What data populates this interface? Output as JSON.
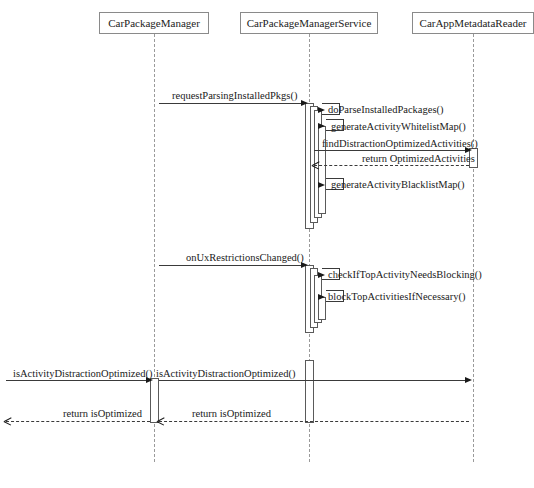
{
  "diagram": {
    "type": "uml-sequence-diagram",
    "width": 534,
    "height": 488,
    "background_color": "#ffffff",
    "line_color": "#3a3a3a",
    "lifeline_color": "#9a9a9a",
    "box_border_color": "#8a8a8a"
  },
  "participants": [
    {
      "id": "car-package-manager",
      "label": "CarPackageManager",
      "box_x": 99,
      "box_y": 12,
      "box_width": 110,
      "lifeline_x": 154,
      "lifeline_top": 34,
      "lifeline_bottom": 462
    },
    {
      "id": "car-package-manager-service",
      "label": "CarPackageManagerService",
      "box_x": 240,
      "box_y": 12,
      "box_width": 138,
      "lifeline_x": 309,
      "lifeline_top": 34,
      "lifeline_bottom": 462
    },
    {
      "id": "car-app-metadata-reader",
      "label": "CarAppMetadataReader",
      "box_x": 412,
      "box_y": 12,
      "box_width": 122,
      "lifeline_x": 473,
      "lifeline_top": 34,
      "lifeline_bottom": 462
    }
  ],
  "messages": [
    {
      "id": "m1",
      "label": "requestParsingInstalledPkgs()",
      "kind": "call",
      "style": "solid",
      "direction": "right",
      "from": "car-package-manager",
      "to": "car-package-manager-service",
      "y": 103,
      "label_x": 172,
      "label_y": 91
    },
    {
      "id": "m2",
      "label": "doParseInstalledPackages()",
      "kind": "self-call",
      "style": "solid",
      "direction": "self",
      "from": "car-package-manager-service",
      "to": "car-package-manager-service",
      "y": 110,
      "label_x": 328,
      "label_y": 105
    },
    {
      "id": "m3",
      "label": "generateActivityWhitelistMap()",
      "kind": "self-call",
      "style": "solid",
      "direction": "self",
      "from": "car-package-manager-service",
      "to": "car-package-manager-service",
      "y": 126,
      "label_x": 331,
      "label_y": 122
    },
    {
      "id": "m4",
      "label": "findDistractionOptimizedActivities()",
      "kind": "call",
      "style": "solid",
      "direction": "right",
      "from": "car-package-manager-service",
      "to": "car-app-metadata-reader",
      "y": 150,
      "label_x": 322,
      "label_y": 139
    },
    {
      "id": "m5",
      "label": "return OptimizedActivities",
      "kind": "return",
      "style": "dashed",
      "direction": "left",
      "from": "car-app-metadata-reader",
      "to": "car-package-manager-service",
      "y": 165,
      "label_x": 362,
      "label_y": 154
    },
    {
      "id": "m6",
      "label": "generateActivityBlacklistMap()",
      "kind": "self-call",
      "style": "solid",
      "direction": "self",
      "from": "car-package-manager-service",
      "to": "car-package-manager-service",
      "y": 185,
      "label_x": 331,
      "label_y": 180
    },
    {
      "id": "m7",
      "label": "onUxRestrictionsChanged()",
      "kind": "call",
      "style": "solid",
      "direction": "right",
      "from": "car-package-manager",
      "to": "car-package-manager-service",
      "y": 265,
      "label_x": 186,
      "label_y": 253
    },
    {
      "id": "m8",
      "label": "checkIfTopActivityNeedsBlocking()",
      "kind": "self-call",
      "style": "solid",
      "direction": "self",
      "from": "car-package-manager-service",
      "to": "car-package-manager-service",
      "y": 275,
      "label_x": 328,
      "label_y": 270
    },
    {
      "id": "m9",
      "label": "blockTopActivitiesIfNecessary()",
      "kind": "self-call",
      "style": "solid",
      "direction": "self",
      "from": "car-package-manager-service",
      "to": "car-package-manager-service",
      "y": 297,
      "label_x": 328,
      "label_y": 292
    },
    {
      "id": "m10",
      "label": "isActivityDistractionOptimized()",
      "kind": "call",
      "style": "solid",
      "direction": "right",
      "from": "external",
      "to": "car-package-manager",
      "y": 380,
      "label_x": 13,
      "label_y": 369
    },
    {
      "id": "m11",
      "label": "isActivityDistractionOptimized()",
      "kind": "call",
      "style": "solid",
      "direction": "right",
      "from": "car-package-manager",
      "to": "car-app-metadata-reader",
      "y": 380,
      "label_x": 156,
      "label_y": 369
    },
    {
      "id": "m12",
      "label": "return isOptimized",
      "kind": "return",
      "style": "dashed",
      "direction": "left",
      "from": "car-app-metadata-reader",
      "to": "car-package-manager",
      "y": 421,
      "label_x": 192,
      "label_y": 409
    },
    {
      "id": "m13",
      "label": "return isOptimized",
      "kind": "return",
      "style": "dashed",
      "direction": "left",
      "from": "car-package-manager",
      "to": "external",
      "y": 421,
      "label_x": 63,
      "label_y": 409
    }
  ],
  "activations": [
    {
      "id": "a1",
      "participant": "car-package-manager-service",
      "x": 305,
      "y": 103,
      "width": 9,
      "height": 126
    },
    {
      "id": "a2",
      "participant": "car-package-manager-service",
      "x": 310,
      "y": 106,
      "width": 8,
      "height": 117
    },
    {
      "id": "a3",
      "participant": "car-package-manager-service",
      "x": 314,
      "y": 110,
      "width": 8,
      "height": 108
    },
    {
      "id": "a4",
      "participant": "car-package-manager-service",
      "x": 318,
      "y": 126,
      "width": 8,
      "height": 88
    },
    {
      "id": "a5",
      "participant": "car-app-metadata-reader",
      "x": 469,
      "y": 148,
      "width": 9,
      "height": 20
    },
    {
      "id": "a6",
      "participant": "car-package-manager-service",
      "x": 305,
      "y": 265,
      "width": 9,
      "height": 68
    },
    {
      "id": "a7",
      "participant": "car-package-manager-service",
      "x": 310,
      "y": 268,
      "width": 8,
      "height": 60
    },
    {
      "id": "a8",
      "participant": "car-package-manager-service",
      "x": 314,
      "y": 275,
      "width": 8,
      "height": 48
    },
    {
      "id": "a9",
      "participant": "car-package-manager-service",
      "x": 318,
      "y": 297,
      "width": 8,
      "height": 23
    },
    {
      "id": "a10",
      "participant": "car-package-manager",
      "x": 150,
      "y": 378,
      "width": 9,
      "height": 45
    },
    {
      "id": "a11",
      "participant": "car-app-metadata-reader",
      "x": 305,
      "y": 360,
      "width": 9,
      "height": 63
    }
  ],
  "self_message_boxes": [
    {
      "id": "s1",
      "x": 322,
      "y": 103,
      "width": 18,
      "height": 12
    },
    {
      "id": "s2",
      "x": 326,
      "y": 119,
      "width": 18,
      "height": 12
    },
    {
      "id": "s3",
      "x": 326,
      "y": 178,
      "width": 18,
      "height": 12
    },
    {
      "id": "s4",
      "x": 322,
      "y": 268,
      "width": 18,
      "height": 12
    },
    {
      "id": "s5",
      "x": 326,
      "y": 290,
      "width": 18,
      "height": 12
    }
  ],
  "caption": {
    "text": "",
    "x": 0,
    "y": 478
  }
}
